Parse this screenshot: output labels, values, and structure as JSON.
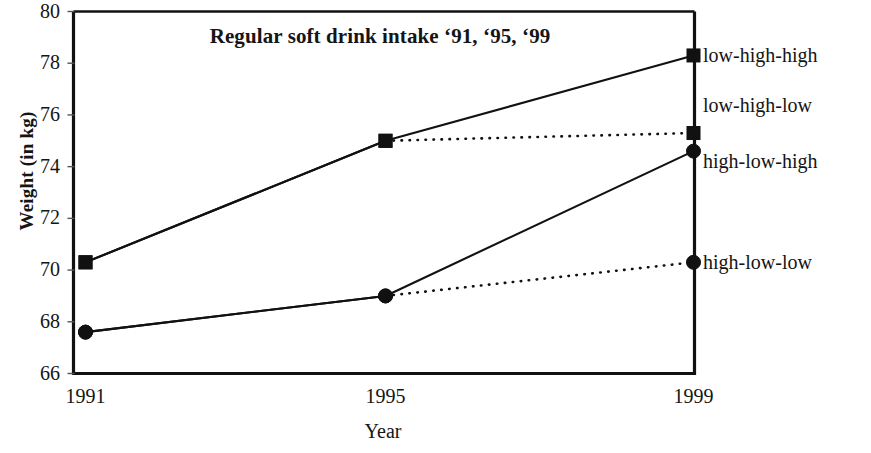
{
  "chart_data": {
    "type": "line",
    "title": "Regular soft drink intake ‘91, ‘95, ‘99",
    "xlabel": "Year",
    "ylabel": "Weight (in kg)",
    "x": [
      1991,
      1995,
      1999
    ],
    "xticklabels": [
      "1991",
      "1995",
      "1999"
    ],
    "yticklabels": [
      "66",
      "68",
      "70",
      "72",
      "74",
      "76",
      "78",
      "80"
    ],
    "ytickvalues": [
      66,
      68,
      70,
      72,
      74,
      76,
      78,
      80
    ],
    "ylim": [
      66,
      80
    ],
    "ytick_step": 2,
    "grid": false,
    "legend_position": "right-inline",
    "line_color": "#111111",
    "series": [
      {
        "name": "low-high-high",
        "values": [
          70.3,
          75.0,
          78.3
        ],
        "marker": "square",
        "linestyle": "solid",
        "label_y_value": 78.3
      },
      {
        "name": "low-high-low",
        "values": [
          70.3,
          75.0,
          75.3
        ],
        "marker": "square",
        "linestyle": "solid-then-dotted",
        "label_y_value": 76.4
      },
      {
        "name": "high-low-high",
        "values": [
          67.6,
          69.0,
          74.6
        ],
        "marker": "circle",
        "linestyle": "solid",
        "label_y_value": 74.2
      },
      {
        "name": "high-low-low",
        "values": [
          67.6,
          69.0,
          70.3
        ],
        "marker": "circle",
        "linestyle": "solid-then-dotted",
        "label_y_value": 70.3
      }
    ]
  }
}
